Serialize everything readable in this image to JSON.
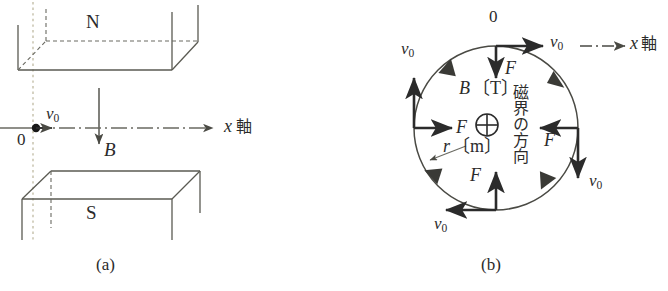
{
  "figure": {
    "title_a": "(a)",
    "title_b": "(b)",
    "accent_color": "#2b2b2b",
    "line_color": "#5a5a52",
    "dash_color": "#6a6a62",
    "guide_color": "#b9b49a"
  },
  "panel_a": {
    "caption": "(a)",
    "pole_north_label": "N",
    "pole_south_label": "S",
    "origin_label": "0",
    "velocity_label": "v",
    "velocity_sub": "0",
    "field_label": "B",
    "axis_label_symbol": "x",
    "axis_label_text": "軸"
  },
  "panel_b": {
    "caption": "(b)",
    "origin_label": "0",
    "axis_label_symbol": "x",
    "axis_label_text": "軸",
    "field_magnitude_label": "B",
    "field_unit_label": "〔T〕",
    "radius_label": "r",
    "radius_unit_label": "〔m〕",
    "field_direction_text": "磁界の方向",
    "into_page_symbol": "⊕",
    "force_label": "F",
    "velocity_label": "v",
    "velocity_sub": "0",
    "forces": [
      {
        "position": "top",
        "label": "F"
      },
      {
        "position": "left",
        "label": "F"
      },
      {
        "position": "right",
        "label": "F"
      },
      {
        "position": "bottom",
        "label": "F"
      }
    ],
    "velocities": [
      {
        "position": "top",
        "label": "v",
        "sub": "0"
      },
      {
        "position": "left",
        "label": "v",
        "sub": "0"
      },
      {
        "position": "right-lower",
        "label": "v",
        "sub": "0"
      },
      {
        "position": "bottom-left",
        "label": "v",
        "sub": "0"
      },
      {
        "position": "axis",
        "label": "v",
        "sub": "0"
      }
    ],
    "rotation_sense": "clockwise"
  }
}
